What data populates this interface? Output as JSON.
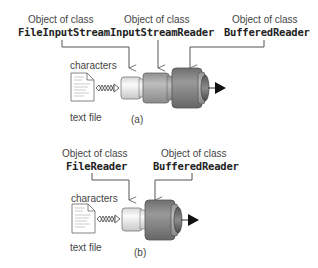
{
  "diagram_a": {
    "caption": "(a)",
    "label_characters": "characters",
    "label_text_file": "text file",
    "objects": [
      {
        "prefix": "Object of class",
        "class_name": "FileInputStream"
      },
      {
        "prefix": "Object of class",
        "class_name": "InputStreamReader"
      },
      {
        "prefix": "Object of class",
        "class_name": "BufferedReader"
      }
    ]
  },
  "diagram_b": {
    "caption": "(b)",
    "label_characters": "characters",
    "label_text_file": "text file",
    "objects": [
      {
        "prefix": "Object of class",
        "class_name": "FileReader"
      },
      {
        "prefix": "Object of class",
        "class_name": "BufferedReader"
      }
    ]
  },
  "colors": {
    "pipe_light": "#f2f2f2",
    "pipe_mid": "#a8a8a8",
    "pipe_dark": "#7a7a7a",
    "line": "#555555",
    "arrow": "#111111"
  }
}
